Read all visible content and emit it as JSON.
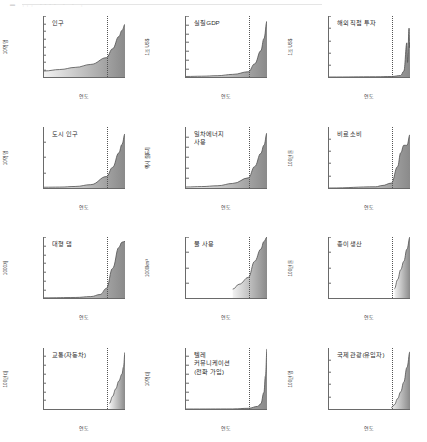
{
  "figure": {
    "header_marks": "▬   ,,,    ----  -  -   ,",
    "xlabel": "연도",
    "x_ticks": [
      "1750",
      "1800",
      "1850",
      "1900",
      "1950",
      "2000"
    ],
    "x_end_label": "2010",
    "xlim": [
      1750,
      2010
    ],
    "divider_year": 1950,
    "line_color": "#4f4f4f",
    "fill_start_color": "#f2f2f2",
    "fill_end_color": "#8a8a8a"
  },
  "chart_data": [
    {
      "type": "area",
      "title": "인구",
      "ylabel": "10억 명",
      "xlabel": "연도",
      "ylim": [
        0,
        8
      ],
      "y_ticks": [
        "0",
        "1",
        "2",
        "3",
        "4",
        "5",
        "6",
        "7",
        "8"
      ],
      "x": [
        1750,
        1800,
        1850,
        1900,
        1950,
        1970,
        1990,
        2000,
        2010
      ],
      "values": [
        0.79,
        0.98,
        1.26,
        1.65,
        2.53,
        3.7,
        5.3,
        6.1,
        6.9
      ]
    },
    {
      "type": "area",
      "title": "실질GDP",
      "ylabel": "1조 US$",
      "xlabel": "연도",
      "ylim": [
        0,
        70
      ],
      "y_ticks": [
        "0",
        "10",
        "20",
        "30",
        "40",
        "50",
        "60",
        "70"
      ],
      "x": [
        1750,
        1800,
        1850,
        1900,
        1950,
        1970,
        1990,
        2000,
        2010
      ],
      "values": [
        0.6,
        0.9,
        1.5,
        3.0,
        6.0,
        15.0,
        30.0,
        44.0,
        64.0
      ]
    },
    {
      "type": "area",
      "title": "해외 직접 투자",
      "ylabel": "1조 US$",
      "xlabel": "연도",
      "ylim": [
        0,
        2.5
      ],
      "y_ticks": [
        "0",
        "0.5",
        "1",
        "1.5",
        "2",
        "2.5"
      ],
      "x": [
        1750,
        1900,
        1950,
        1980,
        1990,
        2000,
        2002,
        2007,
        2009,
        2010
      ],
      "values": [
        0.0,
        0.01,
        0.02,
        0.06,
        0.24,
        1.4,
        0.6,
        2.0,
        1.2,
        1.4
      ]
    },
    {
      "type": "area",
      "title": "도시 인구",
      "ylabel": "10억 명",
      "xlabel": "연도",
      "ylim": [
        0,
        4
      ],
      "y_ticks": [
        "0",
        "1",
        "2",
        "3",
        "4"
      ],
      "x": [
        1750,
        1800,
        1850,
        1900,
        1950,
        1970,
        1990,
        2000,
        2010
      ],
      "values": [
        0.05,
        0.06,
        0.1,
        0.22,
        0.75,
        1.35,
        2.3,
        2.85,
        3.55
      ]
    },
    {
      "type": "area",
      "title": "일차에너지\n사용",
      "ylabel": "엑사 줄[EJ]",
      "xlabel": "연도",
      "ylim": [
        0,
        600
      ],
      "y_ticks": [
        "0",
        "100",
        "200",
        "300",
        "400",
        "500",
        "600"
      ],
      "x": [
        1750,
        1800,
        1850,
        1900,
        1950,
        1970,
        1990,
        2000,
        2010
      ],
      "values": [
        10,
        14,
        22,
        45,
        100,
        210,
        340,
        420,
        540
      ]
    },
    {
      "type": "area",
      "title": "비료 소비",
      "ylabel": "100만 톤",
      "xlabel": "연도",
      "ylim": [
        0,
        200
      ],
      "y_ticks": [
        "0",
        "40",
        "80",
        "120",
        "160",
        "200"
      ],
      "x": [
        1750,
        1900,
        1920,
        1950,
        1970,
        1980,
        1990,
        2000,
        2010
      ],
      "values": [
        0,
        4,
        8,
        16,
        70,
        115,
        140,
        140,
        175
      ]
    },
    {
      "type": "area",
      "title": "대형 댐",
      "ylabel": "1000개",
      "xlabel": "연도",
      "ylim": [
        0,
        35
      ],
      "y_ticks": [
        "0",
        "5",
        "10",
        "15",
        "20",
        "25",
        "30",
        "35"
      ],
      "x": [
        1750,
        1850,
        1900,
        1930,
        1950,
        1970,
        1990,
        2000,
        2010
      ],
      "values": [
        0.1,
        0.3,
        0.8,
        2.0,
        5.5,
        17.0,
        29.0,
        32.0,
        32.5
      ]
    },
    {
      "type": "area",
      "title": "물 사용",
      "ylabel": "1000km³",
      "xlabel": "연도",
      "ylim": [
        0,
        4
      ],
      "y_ticks": [
        "0",
        "1",
        "2",
        "3",
        "4"
      ],
      "x": [
        1900,
        1920,
        1950,
        1970,
        1990,
        2000,
        2010
      ],
      "values": [
        0.58,
        0.9,
        1.35,
        2.4,
        3.2,
        3.7,
        4.0
      ]
    },
    {
      "type": "area",
      "title": "종이 생산",
      "ylabel": "100만 톤",
      "xlabel": "연도",
      "ylim": [
        0,
        400
      ],
      "y_ticks": [
        "0",
        "100",
        "200",
        "300",
        "400"
      ],
      "x": [
        1960,
        1970,
        1980,
        1990,
        2000,
        2010
      ],
      "values": [
        60,
        120,
        185,
        240,
        320,
        400
      ]
    },
    {
      "type": "area",
      "title": "교통(자동차)",
      "ylabel": "100만 대",
      "xlabel": "연도",
      "ylim": [
        0,
        1400
      ],
      "y_ticks": [
        "0",
        "200",
        "400",
        "600",
        "800",
        "1000",
        "1200",
        "1400"
      ],
      "x": [
        1960,
        1970,
        1980,
        1990,
        2000,
        2005,
        2010
      ],
      "values": [
        130,
        290,
        460,
        640,
        800,
        960,
        1300
      ]
    },
    {
      "type": "area",
      "title": "텔레\n커뮤니케이션\n(전화 가입)",
      "ylabel": "10억 대",
      "xlabel": "연도",
      "ylim": [
        0,
        7
      ],
      "y_ticks": [
        "0",
        "1",
        "2",
        "3",
        "4",
        "5",
        "6",
        "7"
      ],
      "x": [
        1750,
        1900,
        1950,
        1980,
        1990,
        2000,
        2005,
        2010
      ],
      "values": [
        0,
        0.01,
        0.08,
        0.3,
        0.6,
        1.9,
        3.8,
        6.9
      ]
    },
    {
      "type": "area",
      "title": "국제 관광(유입자)",
      "ylabel": "100만 명",
      "xlabel": "연도",
      "ylim": [
        0,
        1000
      ],
      "y_ticks": [
        "0",
        "200",
        "400",
        "600",
        "800",
        "1000"
      ],
      "x": [
        1950,
        1960,
        1970,
        1980,
        1990,
        2000,
        2010
      ],
      "values": [
        25,
        70,
        170,
        280,
        440,
        680,
        940
      ]
    }
  ]
}
